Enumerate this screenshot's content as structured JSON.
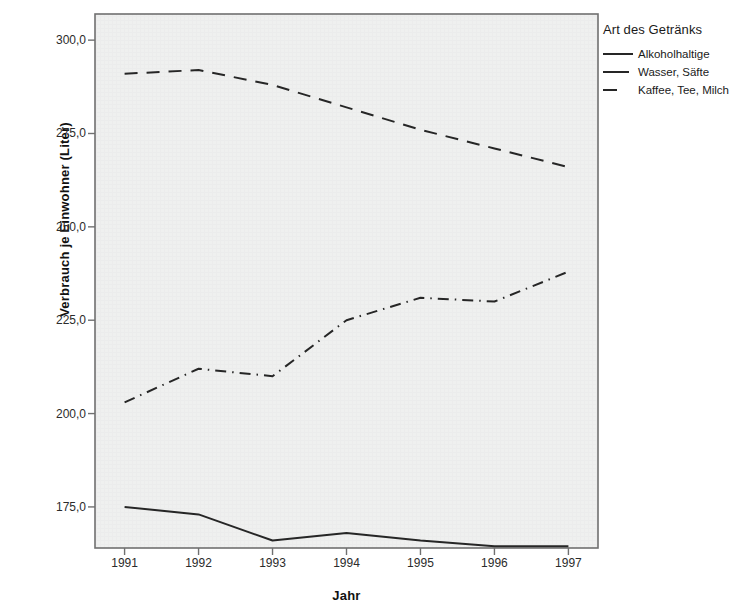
{
  "chart_data": {
    "type": "line",
    "title": "",
    "xlabel": "Jahr",
    "ylabel": "Verbrauch je Einwohner (Liter)",
    "categories": [
      "1991",
      "1992",
      "1993",
      "1994",
      "1995",
      "1996",
      "1997"
    ],
    "x": [
      1991,
      1992,
      1993,
      1994,
      1995,
      1996,
      1997
    ],
    "ylim": [
      164,
      307
    ],
    "xlim": [
      1990.6,
      1997.4
    ],
    "yticks": [
      175,
      200,
      225,
      250,
      275,
      300
    ],
    "ytick_labels": [
      "175,0",
      "200,0",
      "225,0",
      "250,0",
      "275,0",
      "300,0"
    ],
    "grid": false,
    "legend_position": "right",
    "legend_title": "Art des Getränks",
    "series": [
      {
        "name": "Alkoholhaltige",
        "values": [
          175.0,
          173.0,
          166.0,
          168.0,
          166.0,
          164.5,
          164.5
        ],
        "style": "solid",
        "color": "#262626"
      },
      {
        "name": "Wasser, Säfte",
        "values": [
          203.0,
          212.0,
          210.0,
          225.0,
          231.0,
          230.0,
          238.0
        ],
        "style": "dash-dot",
        "color": "#262626"
      },
      {
        "name": "Kaffee, Tee, Milch",
        "values": [
          291.0,
          292.0,
          288.0,
          282.0,
          276.0,
          271.0,
          266.0
        ],
        "style": "dashed",
        "color": "#262626"
      }
    ]
  },
  "colors": {
    "plot_background": "#eff0ef",
    "plot_border": "#6e6e6e",
    "axis_text": "#2b2b2b",
    "series_line": "#262626",
    "page_background": "#ffffff"
  },
  "legend": {
    "title": "Art des Getränks",
    "items": [
      {
        "label": "Alkoholhaltige"
      },
      {
        "label": "Wasser, Säfte"
      },
      {
        "label": "Kaffee, Tee, Milch"
      }
    ]
  },
  "axes": {
    "y_title": "Verbrauch je Einwohner (Liter)",
    "x_title": "Jahr",
    "y_tick_labels": [
      "300,0",
      "275,0",
      "250,0",
      "225,0",
      "200,0",
      "175,0"
    ],
    "x_tick_labels": [
      "1991",
      "1992",
      "1993",
      "1994",
      "1995",
      "1996",
      "1997"
    ]
  }
}
